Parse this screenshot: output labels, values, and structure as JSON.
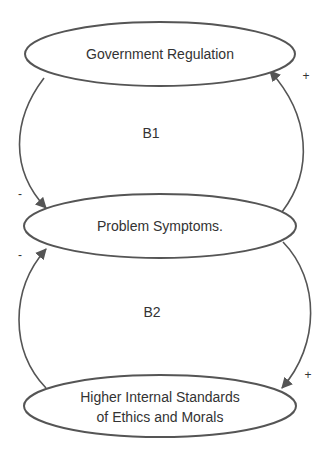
{
  "diagram": {
    "type": "causal-loop",
    "stroke_color": "#555555",
    "nodes": [
      {
        "id": "government_regulation",
        "lines": [
          "Government Regulation"
        ]
      },
      {
        "id": "problem_symptoms",
        "lines": [
          "Problem Symptoms."
        ]
      },
      {
        "id": "higher_standards",
        "lines": [
          "Higher Internal Standards",
          "of Ethics and Morals"
        ]
      }
    ],
    "loops": [
      {
        "label": "B1"
      },
      {
        "label": "B2"
      }
    ],
    "links": [
      {
        "from": "problem_symptoms",
        "to": "government_regulation",
        "polarity": "+"
      },
      {
        "from": "government_regulation",
        "to": "problem_symptoms",
        "polarity": "-"
      },
      {
        "from": "problem_symptoms",
        "to": "higher_standards",
        "polarity": "+"
      },
      {
        "from": "higher_standards",
        "to": "problem_symptoms",
        "polarity": "-"
      }
    ]
  }
}
